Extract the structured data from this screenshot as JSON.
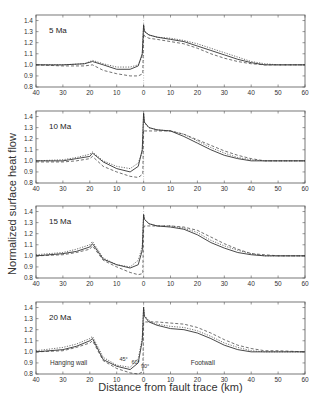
{
  "chart_data": [
    {
      "type": "line",
      "title": "5 Ma",
      "xlabel": "Distance from fault trace (km)",
      "ylabel": "Normalized surface heat flow",
      "xlim": [
        -40,
        60
      ],
      "ylim": [
        0.8,
        1.45
      ],
      "x_tick_labels": [
        "40",
        "30",
        "20",
        "10",
        "0",
        "10",
        "20",
        "30",
        "40",
        "50",
        "60"
      ],
      "y_tick_labels": [
        "0.8",
        "0.9",
        "1.0",
        "1.1",
        "1.2",
        "1.3",
        "1.4"
      ],
      "series": [
        {
          "name": "45°",
          "style": "solid",
          "x": [
            -40,
            -30,
            -22,
            -19,
            -15,
            -10,
            -5,
            -2,
            -0.5,
            0,
            0.3,
            2,
            5,
            10,
            15,
            20,
            25,
            30,
            35,
            40,
            45,
            50,
            60
          ],
          "y": [
            1.0,
            1.0,
            1.01,
            1.03,
            1.0,
            0.96,
            0.96,
            0.99,
            1.1,
            1.36,
            1.3,
            1.27,
            1.25,
            1.23,
            1.21,
            1.17,
            1.13,
            1.09,
            1.05,
            1.02,
            1.0,
            1.0,
            1.0
          ]
        },
        {
          "name": "60°",
          "style": "dotted",
          "x": [
            -40,
            -30,
            -22,
            -19,
            -15,
            -10,
            -5,
            -2,
            -0.5,
            0,
            0.3,
            2,
            5,
            10,
            15,
            20,
            25,
            30,
            35,
            40,
            45,
            50,
            60
          ],
          "y": [
            1.0,
            1.0,
            1.01,
            1.04,
            1.01,
            0.98,
            0.98,
            1.0,
            1.08,
            1.37,
            1.31,
            1.27,
            1.25,
            1.24,
            1.22,
            1.19,
            1.15,
            1.11,
            1.07,
            1.03,
            1.01,
            1.0,
            1.0
          ]
        },
        {
          "name": "90°",
          "style": "dashed",
          "x": [
            -40,
            -30,
            -22,
            -19,
            -15,
            -10,
            -5,
            -2,
            -0.3,
            0,
            0.3,
            2,
            5,
            10,
            15,
            20,
            25,
            30,
            35,
            40,
            45,
            50,
            60
          ],
          "y": [
            1.0,
            0.99,
            0.99,
            1.0,
            0.95,
            0.92,
            0.9,
            0.9,
            0.92,
            1.28,
            1.26,
            1.24,
            1.23,
            1.21,
            1.19,
            1.15,
            1.1,
            1.06,
            1.03,
            1.01,
            1.0,
            1.0,
            1.0
          ]
        }
      ]
    },
    {
      "type": "line",
      "title": "10 Ma",
      "xlim": [
        -40,
        60
      ],
      "ylim": [
        0.8,
        1.45
      ],
      "series": [
        {
          "name": "45°",
          "style": "solid",
          "x": [
            -40,
            -30,
            -25,
            -20,
            -19,
            -15,
            -10,
            -5,
            -2,
            -0.5,
            0,
            0.3,
            2,
            5,
            10,
            15,
            20,
            25,
            30,
            35,
            40,
            45,
            50,
            60
          ],
          "y": [
            1.0,
            1.0,
            1.02,
            1.04,
            1.07,
            0.99,
            0.93,
            0.9,
            0.95,
            1.1,
            1.43,
            1.35,
            1.3,
            1.28,
            1.27,
            1.22,
            1.16,
            1.1,
            1.05,
            1.02,
            1.0,
            1.0,
            1.0,
            1.0
          ]
        },
        {
          "name": "60°",
          "style": "dotted",
          "x": [
            -40,
            -30,
            -25,
            -20,
            -19,
            -15,
            -10,
            -5,
            -2,
            -0.5,
            0,
            0.3,
            2,
            5,
            10,
            15,
            20,
            25,
            30,
            35,
            40,
            45,
            50,
            60
          ],
          "y": [
            1.0,
            1.01,
            1.03,
            1.06,
            1.08,
            1.0,
            0.95,
            0.93,
            0.98,
            1.08,
            1.43,
            1.34,
            1.3,
            1.28,
            1.27,
            1.24,
            1.18,
            1.12,
            1.07,
            1.03,
            1.01,
            1.0,
            1.0,
            1.0
          ]
        },
        {
          "name": "90°",
          "style": "dashed",
          "x": [
            -40,
            -30,
            -25,
            -20,
            -19,
            -15,
            -10,
            -5,
            -2,
            -0.3,
            0,
            0.3,
            2,
            5,
            10,
            15,
            20,
            25,
            30,
            35,
            40,
            45,
            50,
            60
          ],
          "y": [
            0.99,
            0.99,
            1.0,
            1.02,
            1.04,
            0.95,
            0.9,
            0.86,
            0.85,
            0.88,
            1.28,
            1.27,
            1.27,
            1.27,
            1.27,
            1.24,
            1.19,
            1.14,
            1.09,
            1.05,
            1.02,
            1.0,
            1.0,
            1.0
          ]
        }
      ]
    },
    {
      "type": "line",
      "title": "15 Ma",
      "xlim": [
        -40,
        60
      ],
      "ylim": [
        0.8,
        1.45
      ],
      "series": [
        {
          "name": "45°",
          "style": "solid",
          "x": [
            -40,
            -30,
            -25,
            -20,
            -19,
            -15,
            -10,
            -5,
            -2,
            -0.5,
            0,
            0.3,
            2,
            5,
            10,
            15,
            20,
            25,
            30,
            35,
            40,
            45,
            50,
            60
          ],
          "y": [
            1.0,
            1.02,
            1.04,
            1.08,
            1.11,
            0.97,
            0.92,
            0.89,
            0.92,
            1.05,
            1.37,
            1.33,
            1.29,
            1.27,
            1.26,
            1.24,
            1.19,
            1.12,
            1.07,
            1.03,
            1.01,
            1.0,
            1.0,
            1.0
          ]
        },
        {
          "name": "60°",
          "style": "dotted",
          "x": [
            -40,
            -30,
            -25,
            -20,
            -19,
            -15,
            -10,
            -5,
            -2,
            -0.5,
            0,
            0.3,
            2,
            5,
            10,
            15,
            20,
            25,
            30,
            35,
            40,
            45,
            50,
            60
          ],
          "y": [
            1.01,
            1.03,
            1.06,
            1.1,
            1.13,
            0.98,
            0.92,
            0.9,
            0.96,
            1.08,
            1.38,
            1.33,
            1.29,
            1.27,
            1.27,
            1.25,
            1.21,
            1.14,
            1.09,
            1.05,
            1.02,
            1.0,
            1.0,
            1.0
          ]
        },
        {
          "name": "90°",
          "style": "dashed",
          "x": [
            -40,
            -30,
            -25,
            -20,
            -19,
            -15,
            -10,
            -5,
            -2,
            -0.3,
            0,
            0.3,
            2,
            5,
            10,
            15,
            20,
            25,
            30,
            35,
            40,
            45,
            50,
            60
          ],
          "y": [
            1.0,
            1.01,
            1.03,
            1.06,
            1.09,
            0.96,
            0.9,
            0.85,
            0.83,
            0.84,
            1.25,
            1.27,
            1.27,
            1.27,
            1.27,
            1.26,
            1.23,
            1.17,
            1.11,
            1.06,
            1.02,
            1.01,
            1.0,
            1.0
          ]
        }
      ]
    },
    {
      "type": "line",
      "title": "20 Ma",
      "xlim": [
        -40,
        60
      ],
      "ylim": [
        0.8,
        1.45
      ],
      "annotations": [
        "Hanging wall",
        "Footwall",
        "45°",
        "60°",
        "90°"
      ],
      "series": [
        {
          "name": "45°",
          "style": "solid",
          "x": [
            -40,
            -30,
            -25,
            -20,
            -19,
            -15,
            -10,
            -5,
            -2,
            -0.5,
            0,
            0.3,
            2,
            5,
            10,
            15,
            20,
            25,
            30,
            35,
            40,
            45,
            50,
            60
          ],
          "y": [
            1.0,
            1.02,
            1.05,
            1.1,
            1.12,
            0.93,
            0.87,
            0.84,
            0.9,
            1.1,
            1.4,
            1.32,
            1.27,
            1.24,
            1.21,
            1.2,
            1.17,
            1.12,
            1.06,
            1.02,
            1.0,
            1.0,
            1.0,
            1.0
          ]
        },
        {
          "name": "60°",
          "style": "dotted",
          "x": [
            -40,
            -30,
            -25,
            -20,
            -19,
            -15,
            -10,
            -5,
            -2,
            -0.5,
            0,
            0.3,
            2,
            5,
            10,
            15,
            20,
            25,
            30,
            35,
            40,
            45,
            50,
            60
          ],
          "y": [
            1.01,
            1.04,
            1.07,
            1.12,
            1.14,
            0.95,
            0.88,
            0.86,
            0.94,
            1.12,
            1.41,
            1.33,
            1.28,
            1.25,
            1.23,
            1.22,
            1.19,
            1.14,
            1.08,
            1.04,
            1.01,
            1.0,
            1.0,
            1.0
          ]
        },
        {
          "name": "90°",
          "style": "dashed",
          "x": [
            -40,
            -30,
            -25,
            -20,
            -19,
            -15,
            -10,
            -5,
            -2,
            -0.3,
            0,
            0.3,
            2,
            5,
            10,
            15,
            20,
            25,
            30,
            35,
            40,
            45,
            50,
            60
          ],
          "y": [
            1.0,
            1.01,
            1.04,
            1.08,
            1.1,
            0.92,
            0.85,
            0.81,
            0.8,
            0.82,
            1.26,
            1.27,
            1.27,
            1.27,
            1.26,
            1.25,
            1.22,
            1.17,
            1.11,
            1.06,
            1.03,
            1.01,
            1.01,
            1.0
          ]
        }
      ]
    }
  ],
  "axis": {
    "xlabel": "Distance from fault trace (km)",
    "ylabel": "Normalized surface heat flow"
  },
  "panels": [
    {
      "label": "5 Ma"
    },
    {
      "label": "10 Ma"
    },
    {
      "label": "15 Ma"
    },
    {
      "label": "20 Ma",
      "hanging_wall": "Hanging wall",
      "footwall": "Footwall",
      "dip_labels": [
        "45°",
        "60°",
        "90°"
      ]
    }
  ]
}
